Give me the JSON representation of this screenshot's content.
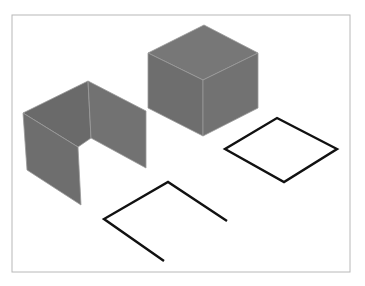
{
  "figure": {
    "frame": {
      "x": 12,
      "y": 15,
      "width": 338,
      "height": 257,
      "stroke": "#b8b8b8"
    },
    "colors": {
      "face_left": "#6e6e6e",
      "face_right": "#727272",
      "face_top": "#777777",
      "face_inner": "#6a6a6a",
      "edge_highlight": "#9a9a9a",
      "outline_stroke": "#111111"
    },
    "shapes": {
      "cube": {
        "top": "204,25 148,53 203,80 258,53",
        "left": "148,53 203,80 203,136 148,108",
        "right": "203,80 258,53 258,108 203,136"
      },
      "open_box": {
        "back_left_wall": "23,113 88,81 91,138 78,147",
        "back_right_wall": "88,81 146,111 146,168 91,138",
        "front_left_wall": "23,113 78,147 81,205 27,170"
      },
      "open_square_path": "164,261 104,219 168,182 227,221",
      "closed_diamond": "277,118 337,149 284,182 225,149"
    }
  }
}
